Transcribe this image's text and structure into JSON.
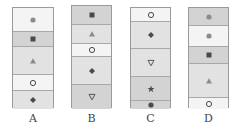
{
  "colors": {
    "light": "#f4f4f4",
    "mid": "#e2e2e2",
    "dark": "#d3d3d3",
    "symbol_dark": "#4a4a4a",
    "symbol_gray": "#8c8c8c"
  },
  "panels": [
    {
      "label": "A",
      "x": 12,
      "y": 7,
      "w": 42,
      "h": 101,
      "segments": [
        {
          "h": 24,
          "shade": "light",
          "symbol": "circle-filled-gray"
        },
        {
          "h": 15,
          "shade": "dark",
          "symbol": "square-filled"
        },
        {
          "h": 28,
          "shade": "mid",
          "symbol": "triangle-up-gray"
        },
        {
          "h": 16,
          "shade": "light",
          "symbol": "circle-ring"
        },
        {
          "h": 18,
          "shade": "mid",
          "symbol": "diamond-filled"
        }
      ]
    },
    {
      "label": "B",
      "x": 71,
      "y": 5,
      "w": 41,
      "h": 103,
      "segments": [
        {
          "h": 19,
          "shade": "dark",
          "symbol": "square-filled"
        },
        {
          "h": 19,
          "shade": "mid",
          "symbol": "triangle-up-gray"
        },
        {
          "h": 13,
          "shade": "light",
          "symbol": "circle-ring"
        },
        {
          "h": 28,
          "shade": "mid",
          "symbol": "diamond-filled"
        },
        {
          "h": 24,
          "shade": "dark",
          "symbol": "triangle-down-ring"
        }
      ]
    },
    {
      "label": "C",
      "x": 130,
      "y": 7,
      "w": 41,
      "h": 101,
      "segments": [
        {
          "h": 14,
          "shade": "light",
          "symbol": "circle-ring"
        },
        {
          "h": 27,
          "shade": "mid",
          "symbol": "diamond-filled"
        },
        {
          "h": 28,
          "shade": "mid",
          "symbol": "triangle-down-ring"
        },
        {
          "h": 24,
          "shade": "dark",
          "symbol": "star-filled"
        },
        {
          "h": 8,
          "shade": "dark",
          "symbol": "circle-filled-dark"
        }
      ]
    },
    {
      "label": "D",
      "x": 188,
      "y": 7,
      "w": 41,
      "h": 101,
      "segments": [
        {
          "h": 18,
          "shade": "dark",
          "symbol": "circle-filled-gray"
        },
        {
          "h": 21,
          "shade": "light",
          "symbol": "circle-filled-gray"
        },
        {
          "h": 17,
          "shade": "dark",
          "symbol": "square-filled"
        },
        {
          "h": 34,
          "shade": "mid",
          "symbol": "triangle-up-gray"
        },
        {
          "h": 11,
          "shade": "light",
          "symbol": "circle-ring"
        }
      ]
    }
  ]
}
